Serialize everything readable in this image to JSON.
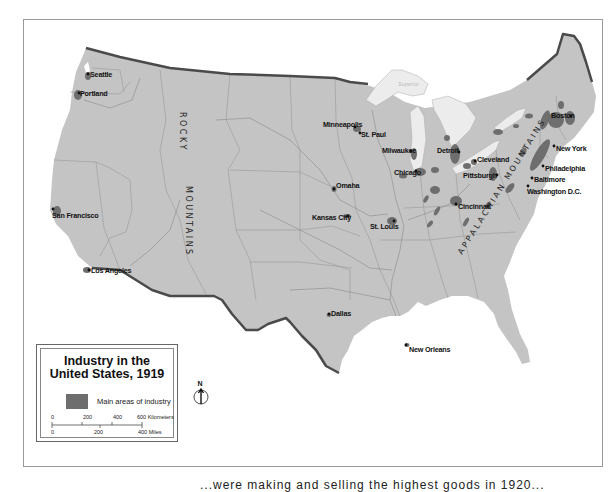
{
  "map": {
    "title": "Industry in the United States, 1919",
    "title_line1": "Industry in the",
    "title_line2": "United States, 1919",
    "legend": {
      "swatch_label": "Main areas of industry",
      "swatch_color": "#6e6e6e"
    },
    "scale": {
      "km_ticks": [
        "0",
        "200",
        "400",
        "600 Kilometers"
      ],
      "mile_ticks": [
        "0",
        "200",
        "400 Miles"
      ]
    },
    "compass": {
      "label": "N"
    },
    "colors": {
      "land": "#c4c4c4",
      "water": "#ffffff",
      "border": "#555555",
      "industry": "#6e6e6e",
      "lakes": "#ececec"
    },
    "mountain_ranges": [
      {
        "name": "ROCKY",
        "line": 1
      },
      {
        "name": "MOUNTAINS",
        "line": 2
      },
      {
        "name": "APPALACHIAN MOUNTAINS"
      }
    ],
    "lakes": [
      "Superior",
      "Michigan",
      "Erie",
      "Ontario"
    ],
    "cities": [
      {
        "name": "Seattle"
      },
      {
        "name": "Portland"
      },
      {
        "name": "San Francisco"
      },
      {
        "name": "Los Angeles"
      },
      {
        "name": "Minneapolis"
      },
      {
        "name": "St. Paul"
      },
      {
        "name": "Milwaukee"
      },
      {
        "name": "Chicago"
      },
      {
        "name": "Omaha"
      },
      {
        "name": "Kansas City"
      },
      {
        "name": "St. Louis"
      },
      {
        "name": "Detroit"
      },
      {
        "name": "Cleveland"
      },
      {
        "name": "Pittsburgh"
      },
      {
        "name": "Cincinnati"
      },
      {
        "name": "Boston"
      },
      {
        "name": "New York"
      },
      {
        "name": "Philadelphia"
      },
      {
        "name": "Baltimore"
      },
      {
        "name": "Washington D.C."
      },
      {
        "name": "Dallas"
      },
      {
        "name": "New Orleans"
      }
    ]
  },
  "caption_fragment": "...were making and selling the highest goods in 1920..."
}
